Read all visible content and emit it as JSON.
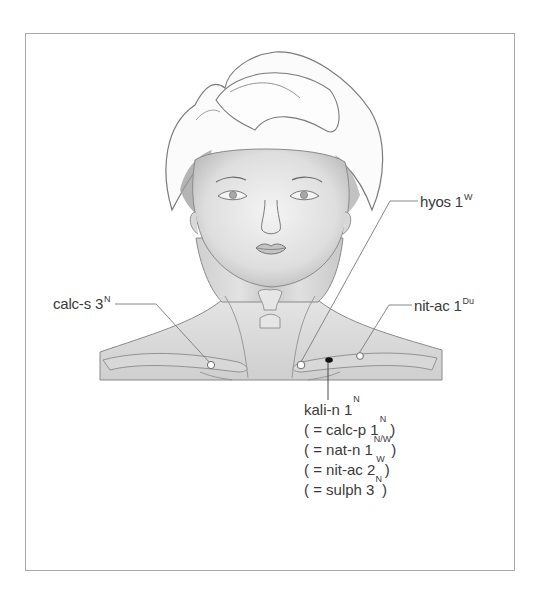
{
  "figure": {
    "labels": {
      "hyos": {
        "name": "hyos 1",
        "sup": "W"
      },
      "calc_s": {
        "name": "calc-s 3",
        "sup": "N"
      },
      "nit_ac": {
        "name": "nit-ac 1",
        "sup": "Du"
      },
      "kali_n": {
        "name": "kali-n 1",
        "sup": "N"
      }
    },
    "equivalents": [
      {
        "prefix": "( = calc-p 1",
        "sup": "N",
        "suffix": " )"
      },
      {
        "prefix": "( = nat-n 1",
        "sup": "N/W",
        "suffix": ")"
      },
      {
        "prefix": "( = nit-ac 2",
        "sup": "W",
        "suffix": ")"
      },
      {
        "prefix": "( = sulph 3",
        "sup": "N",
        "suffix": ")"
      }
    ],
    "points": [
      {
        "id": "calc-s",
        "style": "open"
      },
      {
        "id": "hyos",
        "style": "open"
      },
      {
        "id": "nit-ac",
        "style": "open"
      },
      {
        "id": "kali-n",
        "style": "filled"
      }
    ]
  }
}
